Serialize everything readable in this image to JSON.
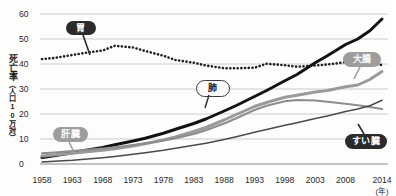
{
  "chart_data": {
    "type": "line",
    "title": "",
    "xlabel": "(年)",
    "ylabel": "死亡率（人口10万対）",
    "ylabel_main": "死亡率",
    "ylabel_sub": "（人口10万対）",
    "xlim": [
      1958,
      2014
    ],
    "ylim": [
      0,
      60
    ],
    "grid": true,
    "legend_position": "inline-callouts",
    "yticks": [
      60,
      50,
      40,
      30,
      20,
      10,
      0
    ],
    "xticks": [
      1958,
      1963,
      1968,
      1973,
      1978,
      1983,
      1988,
      1993,
      1998,
      2003,
      2008,
      2014
    ],
    "x": [
      1958,
      1960,
      1963,
      1965,
      1968,
      1970,
      1973,
      1975,
      1978,
      1980,
      1983,
      1985,
      1988,
      1990,
      1993,
      1995,
      1998,
      2000,
      2003,
      2005,
      2008,
      2010,
      2012,
      2014
    ],
    "series": [
      {
        "name": "胃",
        "label": "胃",
        "color": "#1f1f1f",
        "style": "dotted",
        "width": 2.6,
        "values": [
          42.0,
          42.4,
          43.6,
          44.4,
          45.4,
          47.3,
          46.6,
          45.2,
          43.3,
          41.6,
          40.5,
          39.4,
          38.3,
          38.3,
          38.5,
          40.1,
          39.5,
          38.9,
          39.4,
          39.8,
          40.7,
          40.3,
          40.1,
          39.6
        ]
      },
      {
        "name": "肺",
        "label": "肺",
        "color": "#121212",
        "style": "solid",
        "width": 3.0,
        "values": [
          2.6,
          3.3,
          4.5,
          5.4,
          6.6,
          7.7,
          9.2,
          10.3,
          12.3,
          13.9,
          16.2,
          18.0,
          21.2,
          23.4,
          27.0,
          29.4,
          33.3,
          35.8,
          40.5,
          43.3,
          47.8,
          50.0,
          53.3,
          58.0
        ]
      },
      {
        "name": "大腸",
        "label": "大腸",
        "color": "#9a9a9a",
        "style": "solid",
        "width": 3.0,
        "values": [
          3.2,
          3.6,
          4.3,
          4.8,
          5.5,
          6.1,
          7.2,
          8.1,
          9.6,
          10.8,
          13.0,
          14.6,
          17.6,
          19.8,
          23.0,
          24.6,
          26.7,
          27.5,
          28.8,
          29.4,
          30.9,
          31.6,
          33.8,
          37.0
        ]
      },
      {
        "name": "肝臓",
        "label": "肝臓",
        "color": "#8d8d8d",
        "style": "solid",
        "width": 2.0,
        "values": [
          4.3,
          4.6,
          5.2,
          5.6,
          6.2,
          6.7,
          7.6,
          8.3,
          9.4,
          10.3,
          12.0,
          13.5,
          16.2,
          18.3,
          21.6,
          23.3,
          25.1,
          25.6,
          25.4,
          24.9,
          24.1,
          23.5,
          22.8,
          22.0
        ]
      },
      {
        "name": "すい臓",
        "label": "すい臓",
        "color": "#4a4a4a",
        "style": "solid",
        "width": 1.4,
        "values": [
          0.8,
          1.1,
          1.5,
          1.9,
          2.5,
          3.0,
          3.9,
          4.5,
          5.5,
          6.3,
          7.5,
          8.3,
          9.8,
          10.9,
          12.7,
          13.8,
          15.5,
          16.5,
          18.2,
          19.2,
          21.0,
          22.0,
          23.3,
          25.5
        ]
      }
    ],
    "callouts": [
      {
        "name": "胃",
        "style": "dark",
        "x": 66,
        "y": 21,
        "w": 30,
        "h": 14
      },
      {
        "name": "肺",
        "style": "light",
        "x": 196,
        "y": 80,
        "w": 32,
        "h": 15
      },
      {
        "name": "大腸",
        "style": "gray",
        "x": 343,
        "y": 52,
        "w": 38,
        "h": 15
      },
      {
        "name": "肝臓",
        "style": "gray",
        "x": 53,
        "y": 127,
        "w": 35,
        "h": 15
      },
      {
        "name": "すい臓",
        "style": "dark",
        "x": 345,
        "y": 134,
        "w": 42,
        "h": 15
      }
    ]
  }
}
